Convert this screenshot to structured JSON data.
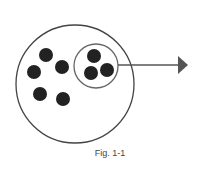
{
  "figure": {
    "caption": "Fig. 1-1",
    "outer_circle": {
      "cx": 75,
      "cy": 84,
      "r": 59
    },
    "inner_circle": {
      "cx": 96,
      "cy": 66,
      "r": 22
    },
    "dots_outside_inner": [
      {
        "cx": 46,
        "cy": 55
      },
      {
        "cx": 34,
        "cy": 72
      },
      {
        "cx": 62,
        "cy": 67
      },
      {
        "cx": 40,
        "cy": 94
      },
      {
        "cx": 63,
        "cy": 99
      }
    ],
    "dots_inside_inner": [
      {
        "cx": 94,
        "cy": 56
      },
      {
        "cx": 91,
        "cy": 73
      },
      {
        "cx": 107,
        "cy": 70
      }
    ],
    "dot_radius": 7,
    "arrow": {
      "x1": 118,
      "y1": 65,
      "x2": 178,
      "y2": 65,
      "tip_x": 188
    },
    "colors": {
      "stroke": "#555555",
      "dot": "#222222",
      "arrow": "#555555"
    }
  }
}
